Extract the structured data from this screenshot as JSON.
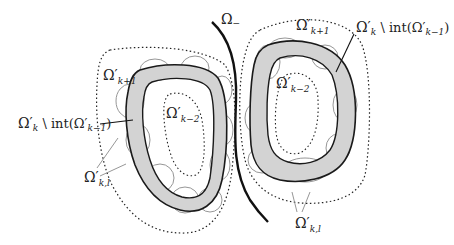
{
  "diagram": {
    "type": "nested-domains-illustration",
    "labels": {
      "omega_minus": {
        "base": "Ω",
        "sub": "−"
      },
      "left": {
        "outer_dotted": {
          "base": "Ω′",
          "sub": "k+1"
        },
        "inner_dotted": {
          "base": "Ω′",
          "sub": "k−2"
        },
        "shaded_band": {
          "prefix_base": "Ω′",
          "prefix_sub": "k",
          "op": " \\ int(Ω′",
          "op_sub": "k−1",
          "close": ")"
        },
        "circles": {
          "base": "Ω′",
          "sub": "k,l"
        }
      },
      "right": {
        "outer_dotted": {
          "base": "Ω′",
          "sub": "k+1"
        },
        "inner_dotted": {
          "base": "Ω′",
          "sub": "k−2"
        },
        "shaded_band": {
          "prefix_base": "Ω′",
          "prefix_sub": "k",
          "op": " \\ int(Ω′",
          "op_sub": "k−1",
          "close": ")"
        },
        "circles": {
          "base": "Ω′",
          "sub": "k,l"
        }
      }
    },
    "colors": {
      "band_fill": "#d3d3d3",
      "band_stroke": "#1a1a1a",
      "circle_stroke": "#8a8a8a",
      "dotted_stroke": "#222222",
      "separator": "#111111"
    }
  }
}
